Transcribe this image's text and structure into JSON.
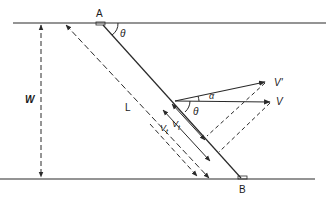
{
  "diagram": {
    "type": "geometry-vector-diagram",
    "colors": {
      "stroke": "#2a2a2a",
      "background": "#ffffff"
    },
    "labels": {
      "point_a": "A",
      "point_b": "B",
      "width": "W",
      "length": "L",
      "theta_top": "θ",
      "theta_vector": "θ",
      "alpha": "α",
      "v_prime": "V'",
      "v": "V",
      "vt_outer": "V",
      "vt_outer_sub": "t",
      "vt_inner": "V",
      "vt_inner_sub": "t"
    },
    "elements": [
      "top-boundary-line",
      "bottom-boundary-line",
      "width-dimension-arrow",
      "length-dimension-arrow",
      "segment-ab",
      "vector-v",
      "vector-v-prime",
      "tangential-component-arrows",
      "projection-lines"
    ]
  }
}
